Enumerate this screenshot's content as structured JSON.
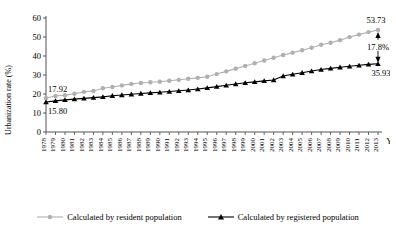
{
  "chart_data": {
    "type": "line",
    "title": "",
    "xlabel": "Year",
    "ylabel": "Urbanization rate (%)",
    "ylim": [
      0,
      60
    ],
    "yticks": [
      0,
      10,
      20,
      30,
      40,
      50,
      60
    ],
    "grid": false,
    "legend_position": "bottom",
    "categories": [
      "1978",
      "1979",
      "1980",
      "1981",
      "1982",
      "1983",
      "1984",
      "1985",
      "1986",
      "1987",
      "1988",
      "1989",
      "1990",
      "1991",
      "1992",
      "1993",
      "1994",
      "1995",
      "1996",
      "1997",
      "1998",
      "1999",
      "2000",
      "2001",
      "2002",
      "2003",
      "2004",
      "2005",
      "2006",
      "2007",
      "2008",
      "2009",
      "2010",
      "2011",
      "2012",
      "2013"
    ],
    "series": [
      {
        "name": "Calculated by resident population",
        "color": "#b0b0b0",
        "marker": "circle",
        "values": [
          17.92,
          18.96,
          19.39,
          20.16,
          21.13,
          21.62,
          23.01,
          23.71,
          24.52,
          25.32,
          25.81,
          26.21,
          26.41,
          26.94,
          27.46,
          27.99,
          28.51,
          29.04,
          30.48,
          31.91,
          33.35,
          34.78,
          36.22,
          37.66,
          39.09,
          40.53,
          41.76,
          42.99,
          44.34,
          45.89,
          46.99,
          48.34,
          49.95,
          51.27,
          52.57,
          53.73
        ]
      },
      {
        "name": "Calculated by registered population",
        "color": "#000000",
        "marker": "triangle",
        "values": [
          15.8,
          16.4,
          16.9,
          17.3,
          17.7,
          18.1,
          18.5,
          19.1,
          19.5,
          19.9,
          20.3,
          20.6,
          20.9,
          21.3,
          21.7,
          22.1,
          22.6,
          23.2,
          23.9,
          24.6,
          25.3,
          25.9,
          26.4,
          26.9,
          27.4,
          29.5,
          30.4,
          31.2,
          32.1,
          32.9,
          33.5,
          34.1,
          34.6,
          35.1,
          35.6,
          35.93
        ]
      }
    ],
    "annotations": [
      {
        "name": "start-resident-value",
        "text": "17.92",
        "x_year": "1978",
        "value": 17.92
      },
      {
        "name": "start-registered-value",
        "text": "15.80",
        "x_year": "1978",
        "value": 15.8
      },
      {
        "name": "end-resident-value",
        "text": "53.73",
        "x_year": "2013",
        "value": 53.73
      },
      {
        "name": "end-registered-value",
        "text": "35.93",
        "x_year": "2013",
        "value": 35.93
      },
      {
        "name": "gap-value",
        "text": "17.8%",
        "x_year": "2013",
        "value": 17.8
      }
    ]
  }
}
